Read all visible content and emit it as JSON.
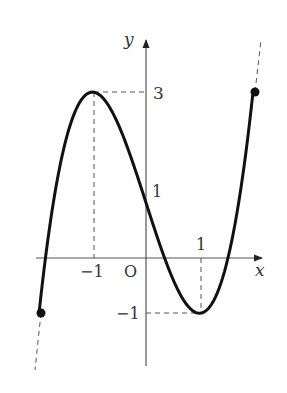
{
  "chart_data": {
    "type": "line",
    "title": "",
    "xlabel": "x",
    "ylabel": "y",
    "origin_label": "O",
    "function": "y = x^3 - 3x + 1",
    "domain": [
      -2,
      2
    ],
    "x_ticks": [
      {
        "value": -1,
        "label": "−1"
      },
      {
        "value": 1,
        "label": "1"
      }
    ],
    "y_ticks": [
      {
        "value": 3,
        "label": "3"
      },
      {
        "value": 1,
        "label": "1"
      },
      {
        "value": -1,
        "label": "−1"
      }
    ],
    "key_points": [
      {
        "x": -2,
        "y": -1,
        "type": "endpoint"
      },
      {
        "x": -1,
        "y": 3,
        "type": "local maximum"
      },
      {
        "x": 0,
        "y": 1,
        "type": "y-intercept"
      },
      {
        "x": 1,
        "y": -1,
        "type": "local minimum"
      },
      {
        "x": 2,
        "y": 3,
        "type": "endpoint"
      }
    ],
    "grid": false,
    "legend": null
  }
}
